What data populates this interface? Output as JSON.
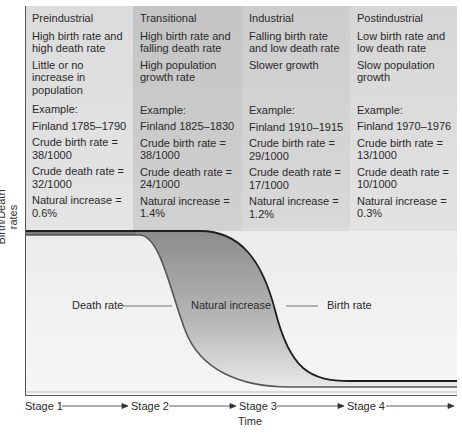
{
  "y_axis_label": "Birth/Death rates",
  "x_axis_label": "Time",
  "stages": [
    {
      "title": "Preindustrial",
      "description": "High birth rate and high death rate",
      "growth": "Little or no increase in population",
      "example_label": "Example:",
      "example": "Finland 1785–1790",
      "birth_rate": "Crude birth rate = 38/1000",
      "death_rate": "Crude death rate = 32/1000",
      "natural_increase": "Natural increase = 0.6%"
    },
    {
      "title": "Transitional",
      "description": "High birth rate and falling death rate",
      "growth": "High population growth rate",
      "example_label": "Example:",
      "example": "Finland 1825–1830",
      "birth_rate": "Crude birth rate = 38/1000",
      "death_rate": "Crude death rate = 24/1000",
      "natural_increase": "Natural increase = 1.4%"
    },
    {
      "title": "Industrial",
      "description": "Falling birth rate and low death rate",
      "growth": "Slower growth",
      "example_label": "Example:",
      "example": "Finland 1910–1915",
      "birth_rate": "Crude birth rate = 29/1000",
      "death_rate": "Crude death rate = 17/1000",
      "natural_increase": "Natural increase = 1.2%"
    },
    {
      "title": "Postindustrial",
      "description": "Low birth rate and low death rate",
      "growth": "Slow population growth",
      "example_label": "Example:",
      "example": "Finland 1970–1976",
      "birth_rate": "Crude birth rate = 13/1000",
      "death_rate": "Crude death rate = 10/1000",
      "natural_increase": "Natural increase = 0.3%"
    }
  ],
  "curve_labels": {
    "death_rate": "Death rate",
    "natural_increase": "Natural increase",
    "birth_rate": "Birth rate"
  },
  "stage_axis": [
    "Stage 1",
    "Stage 2",
    "Stage 3",
    "Stage 4"
  ],
  "colors": {
    "birth_line": "#1e1e1e",
    "death_line": "#555555",
    "natural_increase_fill_top": "#8a8a8a",
    "natural_increase_fill_bottom": "#e6e6e6"
  }
}
